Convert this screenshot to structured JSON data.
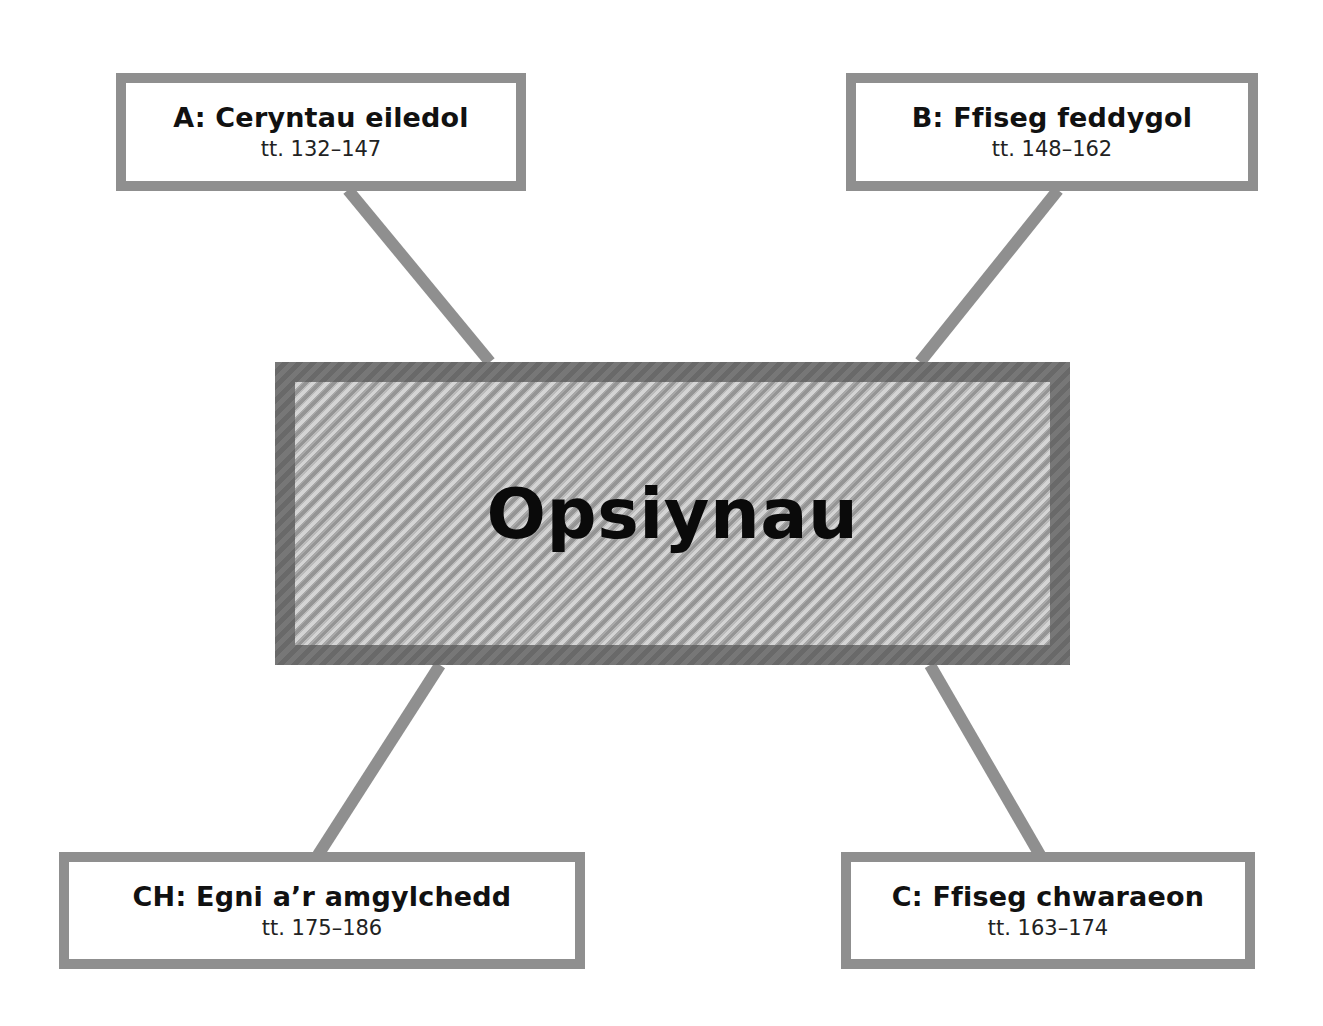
{
  "diagram": {
    "center": {
      "label": "Opsiynau"
    },
    "options": [
      {
        "id": "A",
        "title": "A: Ceryntau eiledol",
        "pages": "tt. 132–147",
        "position": "top-left"
      },
      {
        "id": "B",
        "title": "B: Ffiseg feddygol",
        "pages": "tt. 148–162",
        "position": "top-right"
      },
      {
        "id": "CH",
        "title": "CH: Egni a’r amgylchedd",
        "pages": "tt. 175–186",
        "position": "bottom-left"
      },
      {
        "id": "C",
        "title": "C: Ffiseg chwaraeon",
        "pages": "tt. 163–174",
        "position": "bottom-right"
      }
    ],
    "colors": {
      "box_border": "#8f8f8f",
      "connector": "#8f8f8f",
      "center_border": "#777777",
      "center_fill": "#bdbdbd",
      "text": "#111111"
    }
  }
}
